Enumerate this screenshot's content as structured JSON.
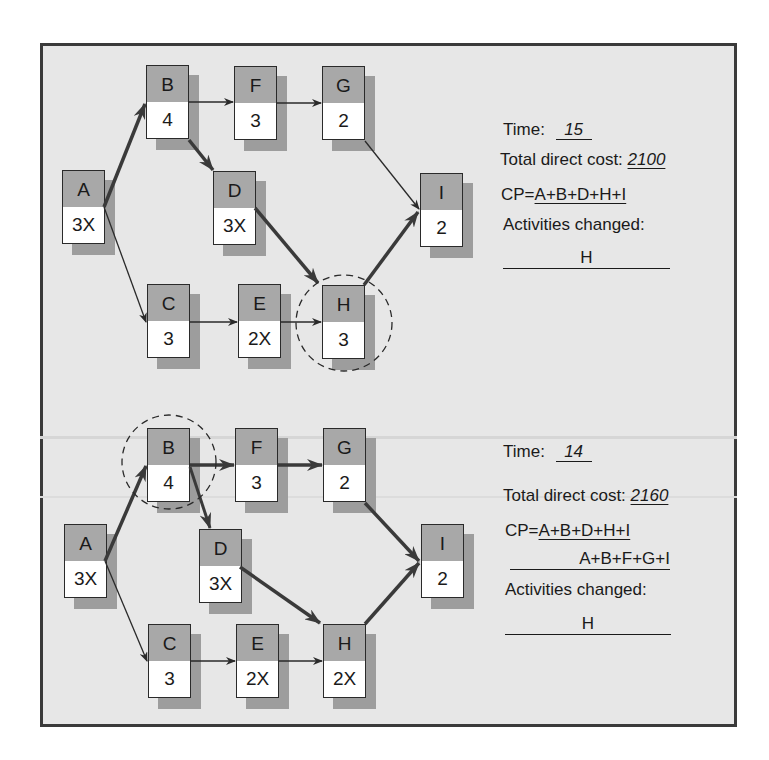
{
  "colors": {
    "background": "#e7e7e7",
    "frame": "#3a3a3a",
    "node_header": "#a8a8a8",
    "node_body": "#ffffff",
    "shadow": "#9d9d9d",
    "line": "#2a2a2a"
  },
  "top_network": {
    "nodes": [
      {
        "id": "A",
        "duration": "3X"
      },
      {
        "id": "B",
        "duration": "4"
      },
      {
        "id": "C",
        "duration": "3"
      },
      {
        "id": "D",
        "duration": "3X"
      },
      {
        "id": "E",
        "duration": "2X"
      },
      {
        "id": "F",
        "duration": "3"
      },
      {
        "id": "G",
        "duration": "2"
      },
      {
        "id": "H",
        "duration": "3"
      },
      {
        "id": "I",
        "duration": "2"
      }
    ],
    "highlighted_node": "H",
    "critical_edges": [
      "A-B",
      "B-D",
      "D-H",
      "H-I"
    ],
    "info": {
      "time_label": "Time:",
      "time_value": "15",
      "cost_label": "Total direct cost:",
      "cost_value": "2100",
      "cp_label": "CP=",
      "cp_paths": [
        "A+B+D+H+I"
      ],
      "activities_label": "Activities changed:",
      "activities_value": "H"
    }
  },
  "bottom_network": {
    "nodes": [
      {
        "id": "A",
        "duration": "3X"
      },
      {
        "id": "B",
        "duration": "4"
      },
      {
        "id": "C",
        "duration": "3"
      },
      {
        "id": "D",
        "duration": "3X"
      },
      {
        "id": "E",
        "duration": "2X"
      },
      {
        "id": "F",
        "duration": "3"
      },
      {
        "id": "G",
        "duration": "2"
      },
      {
        "id": "H",
        "duration": "2X"
      },
      {
        "id": "I",
        "duration": "2"
      }
    ],
    "highlighted_node": "B",
    "critical_edges": [
      "A-B",
      "B-D",
      "B-F",
      "F-G",
      "G-I",
      "D-H",
      "H-I"
    ],
    "info": {
      "time_label": "Time:",
      "time_value": "14",
      "cost_label": "Total direct cost:",
      "cost_value": "2160",
      "cp_label": "CP=",
      "cp_paths": [
        "A+B+D+H+I",
        "A+B+F+G+I"
      ],
      "activities_label": "Activities changed:",
      "activities_value": "H"
    }
  }
}
